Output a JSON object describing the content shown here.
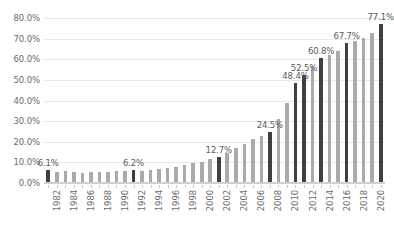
{
  "chart_data": {
    "type": "bar",
    "title": "",
    "subtitle": "",
    "xlabel": "",
    "ylabel": "",
    "ylim": [
      0,
      80
    ],
    "ytick_labels": [
      "0.0%",
      "10.0%",
      "20.0%",
      "30.0%",
      "40.0%",
      "50.0%",
      "60.0%",
      "70.0%",
      "80.0%"
    ],
    "ytick_values": [
      0,
      10,
      20,
      30,
      40,
      50,
      60,
      70,
      80
    ],
    "grid": true,
    "legend": "none",
    "categories": [
      "1982",
      "1983",
      "1984",
      "1985",
      "1986",
      "1987",
      "1988",
      "1989",
      "1990",
      "1991",
      "1992",
      "1993",
      "1994",
      "1995",
      "1996",
      "1997",
      "1998",
      "1999",
      "2000",
      "2001",
      "2002",
      "2003",
      "2004",
      "2005",
      "2006",
      "2007",
      "2008",
      "2009",
      "2010",
      "2011",
      "2012",
      "2013",
      "2014",
      "2015",
      "2016",
      "2017",
      "2018",
      "2019",
      "2020",
      "2021"
    ],
    "xtick_labels": [
      "1982",
      "1984",
      "1986",
      "1988",
      "1990",
      "1992",
      "1994",
      "1996",
      "1998",
      "2000",
      "2002",
      "2004",
      "2006",
      "2008",
      "2010",
      "2012",
      "2014",
      "2016",
      "2018",
      "2020"
    ],
    "values": [
      6.1,
      5.4,
      5.6,
      5.2,
      5.0,
      5.3,
      5.1,
      5.4,
      5.6,
      5.9,
      6.2,
      5.8,
      6.2,
      6.6,
      7.1,
      7.9,
      8.5,
      9.7,
      10.4,
      11.5,
      12.7,
      14.4,
      16.9,
      19.1,
      21.2,
      22.6,
      24.5,
      30.8,
      38.6,
      48.4,
      52.5,
      56.9,
      60.8,
      62.3,
      64.1,
      67.7,
      68.9,
      70.4,
      72.6,
      77.1
    ],
    "highlighted": [
      "1982",
      "1992",
      "2002",
      "2008",
      "2011",
      "2012",
      "2014",
      "2017",
      "2021"
    ],
    "data_labels": [
      {
        "category": "1982",
        "text": "6.1%"
      },
      {
        "category": "1992",
        "text": "6.2%"
      },
      {
        "category": "2002",
        "text": "12.7%"
      },
      {
        "category": "2008",
        "text": "24.5%"
      },
      {
        "category": "2011",
        "text": "48.4%"
      },
      {
        "category": "2012",
        "text": "52.5%"
      },
      {
        "category": "2014",
        "text": "60.8%"
      },
      {
        "category": "2017",
        "text": "67.7%"
      },
      {
        "category": "2021",
        "text": "77.1%"
      }
    ],
    "colors": {
      "bar": "#aaaaaa",
      "bar_highlight": "#404040",
      "grid": "#e8e8e8",
      "text": "#6b6b6b",
      "background": "#ffffff"
    }
  }
}
